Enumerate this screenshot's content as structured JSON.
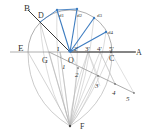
{
  "diagram": {
    "type": "geometric-construction",
    "colors": {
      "construction": "#b5b5b5",
      "axis": "#555555",
      "highlight": "#3d7cc0",
      "label": "#333333"
    },
    "points": {
      "B": "B",
      "D": "D",
      "E": "E",
      "G": "G",
      "O": "O",
      "A": "A",
      "C": "C",
      "F": "F",
      "I": "I",
      "p3prime": "3'",
      "p4prime": "4'",
      "p5prime": "5'",
      "p2prime": "2'"
    },
    "arc_labels": [
      "d1",
      "d2",
      "d3",
      "d4"
    ],
    "division_labels": [
      "1",
      "2",
      "3",
      "4",
      "5"
    ]
  }
}
